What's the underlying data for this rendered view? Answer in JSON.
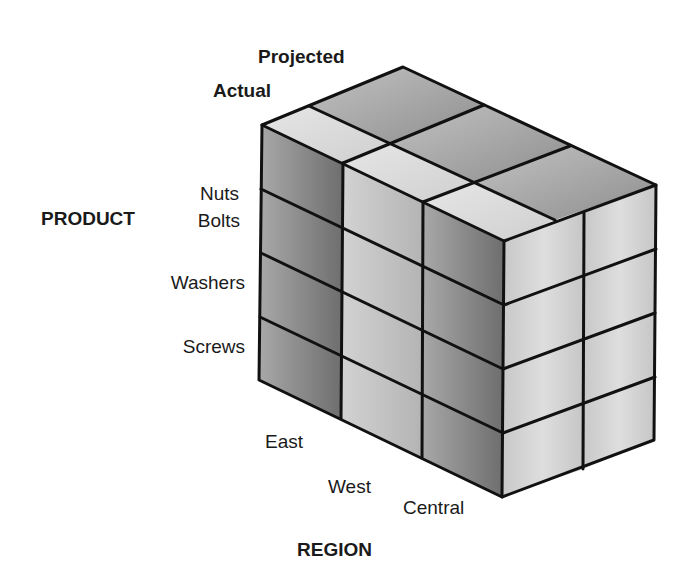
{
  "diagram": {
    "type": "data-cube",
    "axes": {
      "product": {
        "title": "PRODUCT",
        "members": [
          "Nuts",
          "Bolts",
          "Washers",
          "Screws"
        ]
      },
      "region": {
        "title": "REGION",
        "members": [
          "East",
          "West",
          "Central"
        ]
      },
      "measure": {
        "members": [
          "Actual",
          "Projected"
        ]
      }
    },
    "colors": {
      "edge": "#111111",
      "top_light": "#d6d6d6",
      "top_dark": "#9a9a9a",
      "front_dark": "#7a7a7a",
      "front_light": "#c4c4c4",
      "side": "#cfcfcf",
      "background": "#ffffff"
    }
  }
}
